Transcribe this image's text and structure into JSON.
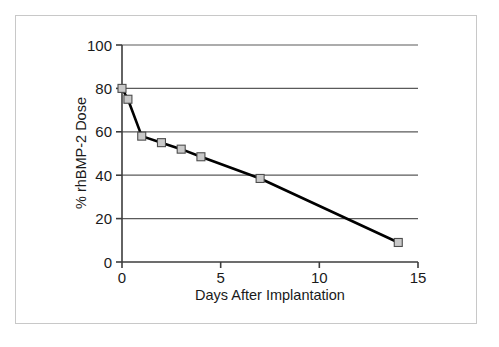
{
  "chart_data": {
    "type": "line",
    "title": "",
    "xlabel": "Days After Implantation",
    "ylabel": "% rhBMP-2 Dose",
    "xlim": [
      0,
      15
    ],
    "ylim": [
      0,
      100
    ],
    "xticks": [
      0,
      5,
      10,
      15
    ],
    "xtick_labels": [
      "0",
      "5",
      "10",
      "15"
    ],
    "yticks": [
      0,
      20,
      40,
      60,
      80,
      100
    ],
    "ytick_labels": [
      "0",
      "20",
      "40",
      "60",
      "80",
      "100"
    ],
    "grid": "horizontal",
    "legend": "none",
    "series": [
      {
        "name": "% rhBMP-2 Dose",
        "marker": "square",
        "marker_fill": "#c9c9c9",
        "marker_edge": "#4d4d4d",
        "line_color": "#000000",
        "x": [
          0,
          0.3,
          1,
          2,
          3,
          4,
          7,
          14
        ],
        "values": [
          80,
          75,
          58,
          55,
          52,
          48.5,
          38.5,
          9
        ]
      }
    ]
  },
  "colors": {
    "background": "#ffffff",
    "frame_border": "#c8c8c8",
    "axis": "#3d3d3d",
    "gridline": "#5a5a5a",
    "text": "#1a1a1a",
    "line": "#000000",
    "marker_fill": "#c9c9c9",
    "marker_edge": "#4d4d4d"
  }
}
